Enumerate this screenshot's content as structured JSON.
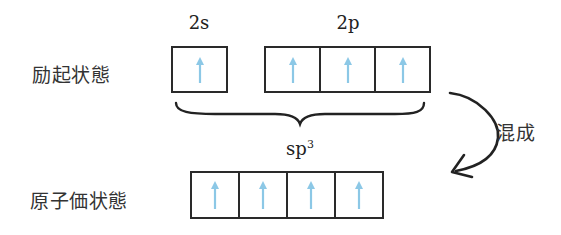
{
  "diagram": {
    "excited_state": {
      "label": "励起状態",
      "orbitals": [
        {
          "name": "2s",
          "electrons": [
            "up"
          ]
        },
        {
          "name": "2p",
          "electrons": [
            "up",
            "up",
            "up"
          ]
        }
      ]
    },
    "valence_state": {
      "label": "原子価状態",
      "orbital_name_base": "sp",
      "orbital_name_sup": "3",
      "electrons": [
        "up",
        "up",
        "up",
        "up"
      ]
    },
    "transition": {
      "label": "混成",
      "arrow": "curved-arrow-down-left"
    },
    "colors": {
      "box_border": "#2a2a2a",
      "electron_arrow": "#8cc8e6",
      "text": "#333333"
    }
  }
}
